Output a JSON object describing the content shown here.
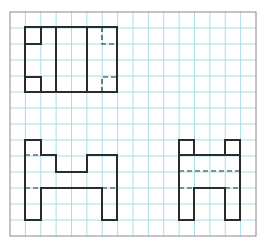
{
  "diagram": {
    "colors": {
      "background": "#ffffff",
      "grid": "#a8dfe6",
      "border": "#8a8a8a",
      "outline": "#2b2b2b",
      "hidden": "#2b2b2b"
    },
    "grid": {
      "x0": 10,
      "y0": 12,
      "x1": 256,
      "y1": 236,
      "cols": 16,
      "rows": 14
    },
    "views": [
      {
        "name": "top-view",
        "solid": [
          [
            [
              25,
              27
            ],
            [
              117,
              27
            ],
            [
              117,
              92
            ],
            [
              25,
              92
            ],
            [
              25,
              27
            ]
          ],
          [
            [
              25,
              44
            ],
            [
              41,
              44
            ],
            [
              41,
              27
            ]
          ],
          [
            [
              25,
              77
            ],
            [
              41,
              77
            ],
            [
              41,
              92
            ]
          ],
          [
            [
              56,
              27
            ],
            [
              56,
              92
            ]
          ],
          [
            [
              87,
              27
            ],
            [
              87,
              92
            ]
          ]
        ],
        "hidden": [
          [
            [
              102,
              27
            ],
            [
              102,
              44
            ],
            [
              117,
              44
            ]
          ],
          [
            [
              102,
              92
            ],
            [
              102,
              77
            ],
            [
              117,
              77
            ]
          ]
        ]
      },
      {
        "name": "front-view",
        "solid": [
          [
            [
              25,
              140
            ],
            [
              41,
              140
            ],
            [
              41,
              155
            ],
            [
              56,
              155
            ],
            [
              56,
              172
            ],
            [
              87,
              172
            ],
            [
              87,
              155
            ],
            [
              117,
              155
            ],
            [
              117,
              220
            ],
            [
              102,
              220
            ],
            [
              102,
              188
            ],
            [
              41,
              188
            ],
            [
              41,
              220
            ],
            [
              25,
              220
            ],
            [
              25,
              140
            ]
          ]
        ],
        "hidden": [
          [
            [
              25,
              155
            ],
            [
              41,
              155
            ]
          ],
          [
            [
              25,
              188
            ],
            [
              41,
              188
            ]
          ],
          [
            [
              102,
              188
            ],
            [
              117,
              188
            ]
          ]
        ]
      },
      {
        "name": "side-view",
        "solid": [
          [
            [
              179,
              140
            ],
            [
              194,
              140
            ],
            [
              194,
              155
            ],
            [
              225,
              155
            ],
            [
              225,
              140
            ],
            [
              240,
              140
            ],
            [
              240,
              220
            ],
            [
              225,
              220
            ],
            [
              225,
              188
            ],
            [
              194,
              188
            ],
            [
              194,
              220
            ],
            [
              179,
              220
            ],
            [
              179,
              140
            ]
          ],
          [
            [
              179,
              155
            ],
            [
              194,
              155
            ]
          ],
          [
            [
              225,
              155
            ],
            [
              240,
              155
            ]
          ]
        ],
        "hidden": [
          [
            [
              179,
              171
            ],
            [
              240,
              171
            ]
          ],
          [
            [
              179,
              188
            ],
            [
              194,
              188
            ]
          ],
          [
            [
              225,
              188
            ],
            [
              240,
              188
            ]
          ]
        ]
      }
    ]
  }
}
